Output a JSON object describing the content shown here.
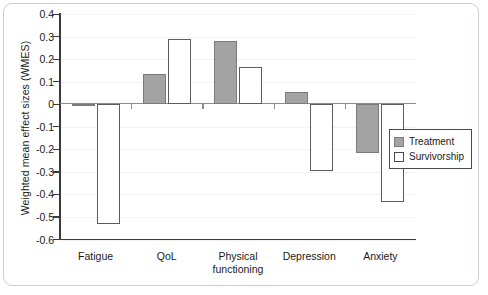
{
  "chart_data": {
    "type": "bar",
    "title": "",
    "xlabel": "",
    "ylabel": "Weighted mean effect sizes (WMES)",
    "categories": [
      "Fatigue",
      "QoL",
      "Physical functioning",
      "Depression",
      "Anxiety"
    ],
    "series": [
      {
        "name": "Treatment",
        "color": "#a3a3a3",
        "values": [
          -0.01,
          0.135,
          0.28,
          0.055,
          -0.22
        ]
      },
      {
        "name": "Survivorship",
        "color": "#ffffff",
        "values": [
          -0.535,
          0.29,
          0.165,
          -0.3,
          -0.435
        ]
      }
    ],
    "ylim": [
      -0.6,
      0.4
    ],
    "ytick_labels": [
      "0.4",
      "0.3",
      "0.2",
      "0.1",
      "0",
      "-0.1",
      "-0.2",
      "-0.3",
      "-0.4",
      "-0.5",
      "-0.6"
    ],
    "ytick_values": [
      0.4,
      0.3,
      0.2,
      0.1,
      0,
      -0.1,
      -0.2,
      -0.3,
      -0.4,
      -0.5,
      -0.6
    ],
    "grid": true,
    "legend_position": "right",
    "legend_entries": [
      "Treatment",
      "Survivorship"
    ]
  }
}
